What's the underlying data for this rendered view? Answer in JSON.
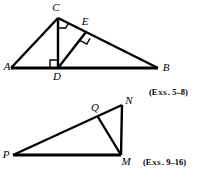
{
  "page": {
    "width": 201,
    "height": 177,
    "background": "#ffffff",
    "ink_color": "#000000"
  },
  "figures": [
    {
      "id": "figure-top",
      "name": "triangle-abc-with-altitude",
      "caption": "(Exs. 5–8)",
      "caption_parts": {
        "prefix": "(E",
        "small_caps": "XS",
        "suffix": ". 5–8)"
      },
      "vertices": [
        {
          "label": "A",
          "x": 11,
          "y": 68,
          "label_x": 7,
          "label_y": 70
        },
        {
          "label": "B",
          "x": 158,
          "y": 68,
          "label_x": 164,
          "label_y": 71
        },
        {
          "label": "C",
          "x": 58,
          "y": 18,
          "label_x": 54,
          "label_y": 11
        },
        {
          "label": "D",
          "x": 58,
          "y": 68,
          "label_x": 55,
          "label_y": 80
        },
        {
          "label": "E",
          "x": 86,
          "y": 32,
          "label_x": 83,
          "label_y": 25
        }
      ],
      "segments": [
        {
          "name": "side-AB",
          "from": "A",
          "to": "B",
          "weight": "thick"
        },
        {
          "name": "side-AC",
          "from": "A",
          "to": "C",
          "weight": "med"
        },
        {
          "name": "side-CB",
          "from": "C",
          "to": "B",
          "weight": "med"
        },
        {
          "name": "altitude-CD",
          "from": "C",
          "to": "D",
          "weight": "med"
        },
        {
          "name": "segment-DE",
          "from": "D",
          "to": "E",
          "weight": "med"
        }
      ],
      "right_angles": [
        {
          "name": "right-angle-at-D",
          "at": "D"
        },
        {
          "name": "right-angle-at-C",
          "at": "C"
        },
        {
          "name": "right-angle-at-E",
          "at": "E"
        }
      ]
    },
    {
      "id": "figure-bottom",
      "name": "triangle-pmn-with-cevian",
      "caption": "(Exs. 9–16)",
      "caption_parts": {
        "prefix": "(E",
        "small_caps": "XS",
        "suffix": ". 9–16)"
      },
      "vertices": [
        {
          "label": "P",
          "x": 13,
          "y": 155,
          "label_x": 5,
          "label_y": 157
        },
        {
          "label": "M",
          "x": 120,
          "y": 155,
          "label_x": 124,
          "label_y": 164
        },
        {
          "label": "N",
          "x": 122,
          "y": 105,
          "label_x": 127,
          "label_y": 104
        },
        {
          "label": "Q",
          "x": 98,
          "y": 117,
          "label_x": 92,
          "label_y": 112
        }
      ],
      "segments": [
        {
          "name": "side-PM",
          "from": "P",
          "to": "M",
          "weight": "thick"
        },
        {
          "name": "side-PN",
          "from": "P",
          "to": "N",
          "weight": "med"
        },
        {
          "name": "side-MN",
          "from": "M",
          "to": "N",
          "weight": "med"
        },
        {
          "name": "cevian-QM",
          "from": "Q",
          "to": "M",
          "weight": "med"
        }
      ],
      "right_angles": []
    }
  ],
  "captions": {
    "top": "(Exs. 5–8)",
    "bottom": "(Exs. 9–16)"
  }
}
